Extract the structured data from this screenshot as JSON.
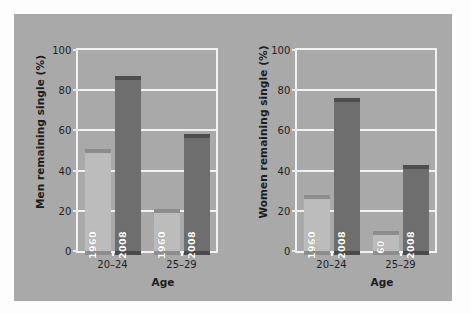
{
  "figure": {
    "background_color": "#a9a9a9",
    "page_color": "#fdfdfd",
    "grid_color": "#f2f2f2"
  },
  "chart_data": [
    {
      "type": "bar",
      "id": "men",
      "title": "",
      "ylabel": "Men remaining single (%)",
      "xlabel": "Age",
      "categories": [
        "20–24",
        "25–29"
      ],
      "ylim": [
        0,
        100
      ],
      "yticks": [
        0,
        20,
        40,
        60,
        80,
        100
      ],
      "ytick_labels": [
        "0",
        "20",
        "40",
        "60",
        "80",
        "100"
      ],
      "grid": true,
      "legend": "none",
      "series": [
        {
          "name": "1960",
          "label": "1960",
          "color": "#bcbcbc",
          "top_color": "#8d8d8d",
          "values": [
            51,
            21
          ]
        },
        {
          "name": "2008",
          "label": "2008",
          "color": "#6e6e6e",
          "top_color": "#4e4e4e",
          "values": [
            87,
            58
          ]
        }
      ],
      "bar_labels": [
        {
          "group": "20–24",
          "series": "1960",
          "text": "1960"
        },
        {
          "group": "20–24",
          "series": "2008",
          "text": "2008"
        },
        {
          "group": "25–29",
          "series": "1960",
          "text": "1960"
        },
        {
          "group": "25–29",
          "series": "2008",
          "text": "2008"
        }
      ]
    },
    {
      "type": "bar",
      "id": "women",
      "title": "",
      "ylabel": "Women remaining single (%)",
      "xlabel": "Age",
      "categories": [
        "20–24",
        "25–29"
      ],
      "ylim": [
        0,
        100
      ],
      "yticks": [
        0,
        20,
        40,
        60,
        80,
        100
      ],
      "ytick_labels": [
        "0",
        "20",
        "40",
        "60",
        "80",
        "100"
      ],
      "grid": true,
      "legend": "none",
      "series": [
        {
          "name": "1960",
          "label": "1960",
          "color": "#bcbcbc",
          "top_color": "#8d8d8d",
          "values": [
            28,
            10
          ]
        },
        {
          "name": "2008",
          "label": "2008",
          "color": "#6e6e6e",
          "top_color": "#4e4e4e",
          "values": [
            76,
            43
          ]
        }
      ],
      "bar_labels": [
        {
          "group": "20–24",
          "series": "1960",
          "text": "1960"
        },
        {
          "group": "20–24",
          "series": "2008",
          "text": "2008"
        },
        {
          "group": "25–29",
          "series": "1960",
          "text": "60"
        },
        {
          "group": "25–29",
          "series": "2008",
          "text": "2008"
        }
      ]
    }
  ]
}
